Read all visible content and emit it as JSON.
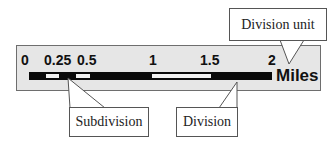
{
  "diagram": {
    "type": "scale-bar",
    "unit_label": "Miles",
    "ticks": [
      {
        "label": "0",
        "x": 21
      },
      {
        "label": "0.25",
        "x": 44
      },
      {
        "label": "0.5",
        "x": 77
      },
      {
        "label": "1",
        "x": 149
      },
      {
        "label": "1.5",
        "x": 200
      },
      {
        "label": "2",
        "x": 268
      }
    ],
    "segments": [
      {
        "kind": "subdivision",
        "from": 0,
        "to": 0.125,
        "fill": "black"
      },
      {
        "kind": "subdivision",
        "from": 0.125,
        "to": 0.25,
        "fill": "white"
      },
      {
        "kind": "subdivision",
        "from": 0.25,
        "to": 0.375,
        "fill": "black"
      },
      {
        "kind": "subdivision",
        "from": 0.375,
        "to": 0.5,
        "fill": "white"
      },
      {
        "kind": "division",
        "from": 0.5,
        "to": 1,
        "fill": "black"
      },
      {
        "kind": "division",
        "from": 1,
        "to": 1.5,
        "fill": "white"
      },
      {
        "kind": "division",
        "from": 1.5,
        "to": 2,
        "fill": "black"
      }
    ],
    "callouts": {
      "division_unit": "Division unit",
      "subdivision": "Subdivision",
      "division": "Division"
    },
    "colors": {
      "panel": "#e6e6e6",
      "bar": "#0a0a0a",
      "light_segment": "#f2f2f2",
      "callout_border": "#555555"
    }
  }
}
